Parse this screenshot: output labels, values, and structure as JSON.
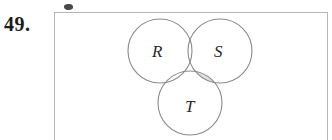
{
  "page": {
    "background_color": "#ffffff",
    "width": 332,
    "height": 140
  },
  "problem": {
    "number_label": "49."
  },
  "figure": {
    "type": "venn-diagram-3-set",
    "border_color": "#b7b7b7",
    "fill_color": "#ffffff",
    "stroke_color": "#8a8a8a",
    "shade_color": "#e0e0e0",
    "shaded_region_description": "S intersect T, excluding R",
    "artifact": {
      "name": "scan-smudge",
      "color": "#3a3a3a"
    },
    "circles": [
      {
        "id": "R",
        "label": "R",
        "cx": 160,
        "cy": 51,
        "r": 32,
        "label_x": 152,
        "label_y": 57
      },
      {
        "id": "S",
        "label": "S",
        "cx": 220,
        "cy": 51,
        "r": 32,
        "label_x": 214,
        "label_y": 57
      },
      {
        "id": "T",
        "label": "T",
        "cx": 190,
        "cy": 103,
        "r": 32,
        "label_x": 185,
        "label_y": 112
      }
    ]
  }
}
